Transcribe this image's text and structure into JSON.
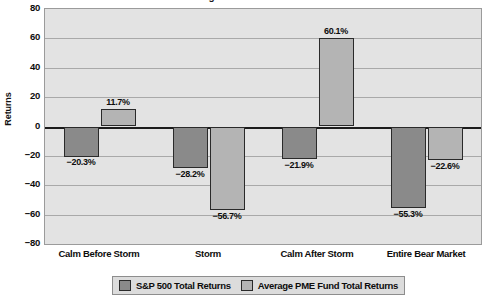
{
  "chart_data": {
    "type": "bar",
    "title": "Earning the 2.0% Bear Market",
    "categories": [
      "Calm Before Storm",
      "Storm",
      "Calm After Storm",
      "Entire Bear Market"
    ],
    "series": [
      {
        "name": "S&P 500 Total Returns",
        "color": "#8a8a8a",
        "values": [
          -20.3,
          -28.2,
          -21.9,
          -55.3
        ],
        "labels": [
          "−20.3%",
          "−28.2%",
          "−21.9%",
          "−55.3%"
        ]
      },
      {
        "name": "Average PME Fund Total Returns",
        "color": "#b4b4b4",
        "values": [
          11.7,
          -56.7,
          60.1,
          -22.6
        ],
        "labels": [
          "11.7%",
          "−56.7%",
          "60.1%",
          "−22.6%"
        ]
      }
    ],
    "xlabel": "",
    "ylabel": "Returns",
    "ylim": [
      -80,
      80
    ],
    "ytick_values": [
      80,
      60,
      40,
      20,
      0,
      -20,
      -40,
      -60,
      -80
    ],
    "ytick_labels": [
      "80",
      "60",
      "40",
      "20",
      "0",
      "−20",
      "−40",
      "−60",
      "−80"
    ],
    "grid": true,
    "legend_position": "bottom",
    "plot_background": "#e3e3e3",
    "gridline_color": "#a9a9a9",
    "axis_color": "#1c1c1c"
  }
}
